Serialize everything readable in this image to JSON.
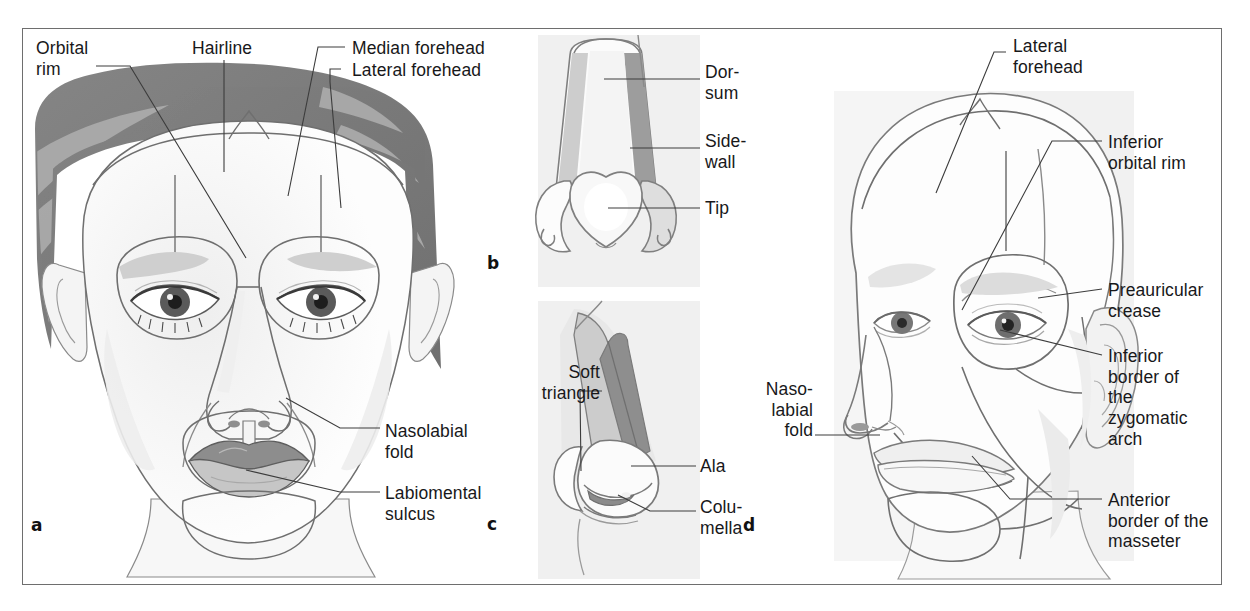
{
  "figure": {
    "panels": [
      {
        "id": "a",
        "letter": "a",
        "caption": "Frontal view of the face with aesthetic units outlined"
      },
      {
        "id": "b",
        "letter": "b",
        "caption": "Frontal view of the nose with nasal subunits"
      },
      {
        "id": "c",
        "letter": "c",
        "caption": "Oblique view of the nose with nasal subunits"
      },
      {
        "id": "d",
        "letter": "d",
        "caption": "Oblique view of the face with aesthetic units outlined"
      }
    ]
  },
  "panel_a": {
    "letter": "a",
    "labels": {
      "orbital_rim": "Orbital\nrim",
      "hairline": "Hairline",
      "median_forehead": "Median forehead",
      "lateral_forehead": "Lateral forehead",
      "nasolabial_fold": "Nasolabial\nfold",
      "labiomental_sulcus": "Labiomental\nsulcus"
    }
  },
  "panel_b": {
    "letter": "b",
    "labels": {
      "dorsum": "Dor-\nsum",
      "sidewall": "Side-\nwall",
      "tip": "Tip"
    }
  },
  "panel_c": {
    "letter": "c",
    "labels": {
      "soft_triangle": "Soft\ntriangle",
      "ala": "Ala",
      "columella": "Colu-\nmella"
    }
  },
  "panel_d": {
    "letter": "d",
    "labels": {
      "lateral_forehead": "Lateral\nforehead",
      "inferior_orbital_rim": "Inferior\norbital rim",
      "preauricular_crease": "Preauricular\ncrease",
      "inferior_border_zygomatic_arch": "Inferior\nborder of\nthe\nzygomatic\narch",
      "anterior_border_masseter": "Anterior\nborder of the\nmasseter",
      "nasolabial_fold": "Naso-\nlabial\nfold"
    }
  },
  "colors": {
    "frame_border": "#6e6e6e",
    "page_background": "#ffffff",
    "label_text": "#18181a",
    "leader_line": "#3c3c3c",
    "hair_dark": "#7b7b7b",
    "hair_light": "#a9a9a9",
    "skin": "#fbfbfb",
    "skin_shadow": "#e4e4e4",
    "outline": "#7a7a7a",
    "outline_dark": "#5c5c5c",
    "inset_background": "#f0f0f0",
    "nose_dorsum_light": "#cfcfcf",
    "nose_sidewall_dark": "#9a9a9a",
    "lip_dark": "#8e8e8e",
    "lip_light": "#c9c9c9",
    "iris": "#4a4a4a",
    "panel_d_background": "#f4f4f4"
  }
}
